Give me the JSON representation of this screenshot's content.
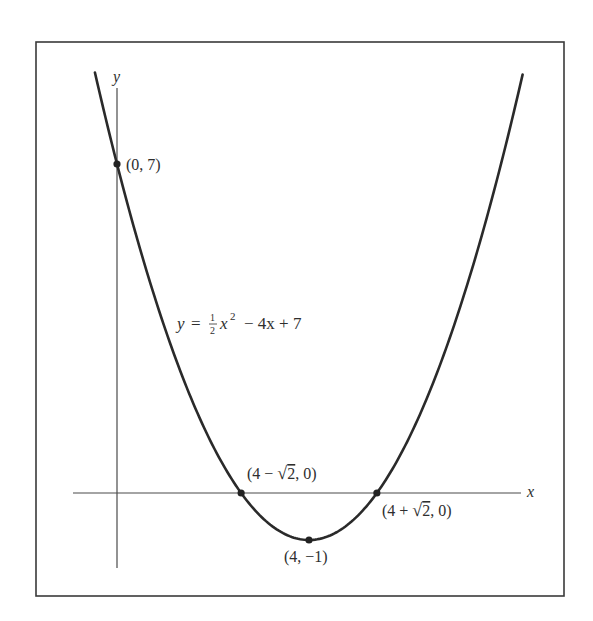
{
  "figure": {
    "frame": {
      "x": 36,
      "y": 42,
      "width": 528,
      "height": 554,
      "stroke": "#3a3a3a"
    },
    "axes": {
      "origin_px": {
        "x": 117,
        "y": 493
      },
      "unit_px": {
        "x": 48,
        "y": 47
      },
      "x_axis": {
        "from_px": 73,
        "to_px": 521,
        "label": "x"
      },
      "y_axis": {
        "from_px": 88,
        "to_px": 568,
        "label": "y"
      },
      "color": "#4a4a4a"
    },
    "curve": {
      "equation_label": "y = ½ x² − 4x + 7",
      "equation_parts": {
        "lhs": "y",
        "eq": "=",
        "frac_num": "1",
        "frac_den": "2",
        "var": "x",
        "exp": "2",
        "rest": "− 4x + 7"
      },
      "a": 0.5,
      "b": -4,
      "c": 7,
      "x_range": [
        -0.46,
        8.45
      ],
      "color": "#2a2a2a"
    },
    "points": [
      {
        "id": "y-intercept",
        "x": 0,
        "y": 7,
        "label": "(0, 7)"
      },
      {
        "id": "root-left",
        "x": 2.586,
        "y": 0,
        "label_pre": "(4 − ",
        "label_sqrt": "2",
        "label_post": ", 0)"
      },
      {
        "id": "root-right",
        "x": 5.414,
        "y": 0,
        "label_pre": "(4 + ",
        "label_sqrt": "2",
        "label_post": ", 0)"
      },
      {
        "id": "vertex",
        "x": 4,
        "y": -1,
        "label": "(4, −1)"
      }
    ]
  },
  "chart_data": {
    "type": "line",
    "title": "",
    "equation": "y = (1/2)x^2 - 4x + 7",
    "xlabel": "x",
    "ylabel": "y",
    "grid": false,
    "x": [
      -0.46,
      0,
      1,
      2,
      2.586,
      3,
      4,
      5,
      5.414,
      6,
      7,
      8,
      8.45
    ],
    "values": [
      8.95,
      7,
      3.5,
      1,
      0,
      -0.5,
      -1,
      -0.5,
      0,
      1,
      3.5,
      7,
      9.9
    ],
    "labeled_points": [
      {
        "x": 0,
        "y": 7,
        "label": "(0, 7)"
      },
      {
        "x": 2.586,
        "y": 0,
        "label": "(4 − √2, 0)"
      },
      {
        "x": 5.414,
        "y": 0,
        "label": "(4 + √2, 0)"
      },
      {
        "x": 4,
        "y": -1,
        "label": "(4, −1)"
      }
    ]
  }
}
